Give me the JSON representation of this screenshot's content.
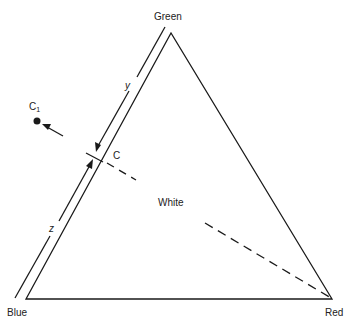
{
  "diagram": {
    "type": "color-triangle",
    "vertices": {
      "green": "Green",
      "blue": "Blue",
      "red": "Red"
    },
    "center_label": "White",
    "point_labels": {
      "c": "C",
      "c1": "C",
      "c1_sub": "1"
    },
    "segment_labels": {
      "y": "y",
      "z": "z"
    },
    "colors": {
      "line": "#1a1a1a",
      "background": "#ffffff"
    }
  }
}
